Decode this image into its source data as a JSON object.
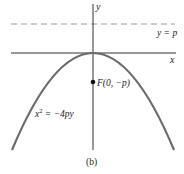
{
  "figure": {
    "caption": "(b)",
    "axis_labels": {
      "x": "x",
      "y": "y"
    },
    "directrix_label": "y = p",
    "focus_label": "F(0, −p)",
    "equation_label_base": "x",
    "equation_label_exp": "2",
    "equation_label_rest": " = −4py",
    "colors": {
      "axes": "#333333",
      "parabola": "#6b6b6b",
      "directrix": "#999999",
      "focus": "#111111"
    }
  }
}
